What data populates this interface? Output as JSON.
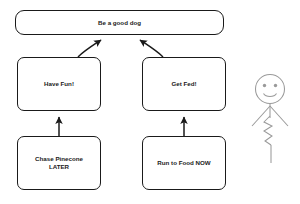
{
  "canvas": {
    "width": 300,
    "height": 204,
    "background_color": "#ffffff",
    "stroke_color": "#1a1a1a",
    "sketch_stroke_color": "#9a9a9a"
  },
  "diagram": {
    "type": "goal-hierarchy-flowchart",
    "nodes": [
      {
        "id": "goal",
        "label": "Be a good dog",
        "level": "top",
        "shape": "rounded-rectangle"
      },
      {
        "id": "have-fun",
        "label": "Have Fun!",
        "level": "middle",
        "shape": "rounded-rectangle"
      },
      {
        "id": "get-fed",
        "label": "Get Fed!",
        "level": "middle",
        "shape": "rounded-rectangle"
      },
      {
        "id": "chase-pinecone",
        "label": "Chase Pinecone\nLATER",
        "level": "bottom",
        "shape": "rounded-rectangle"
      },
      {
        "id": "run-to-food",
        "label": "Run to Food NOW",
        "level": "bottom",
        "shape": "rounded-rectangle"
      }
    ],
    "edges": [
      {
        "from": "have-fun",
        "to": "goal",
        "style": "diagonal-arrow-up"
      },
      {
        "from": "get-fed",
        "to": "goal",
        "style": "diagonal-arrow-up"
      },
      {
        "from": "chase-pinecone",
        "to": "have-fun",
        "style": "vertical-arrow-up"
      },
      {
        "from": "run-to-food",
        "to": "get-fed",
        "style": "vertical-arrow-up"
      }
    ]
  },
  "stick_figure": {
    "name": "smiling-stick-figure",
    "features": [
      "round-head",
      "two-dot-eyes",
      "smile",
      "v-arms",
      "zigzag-body",
      "leg"
    ]
  }
}
